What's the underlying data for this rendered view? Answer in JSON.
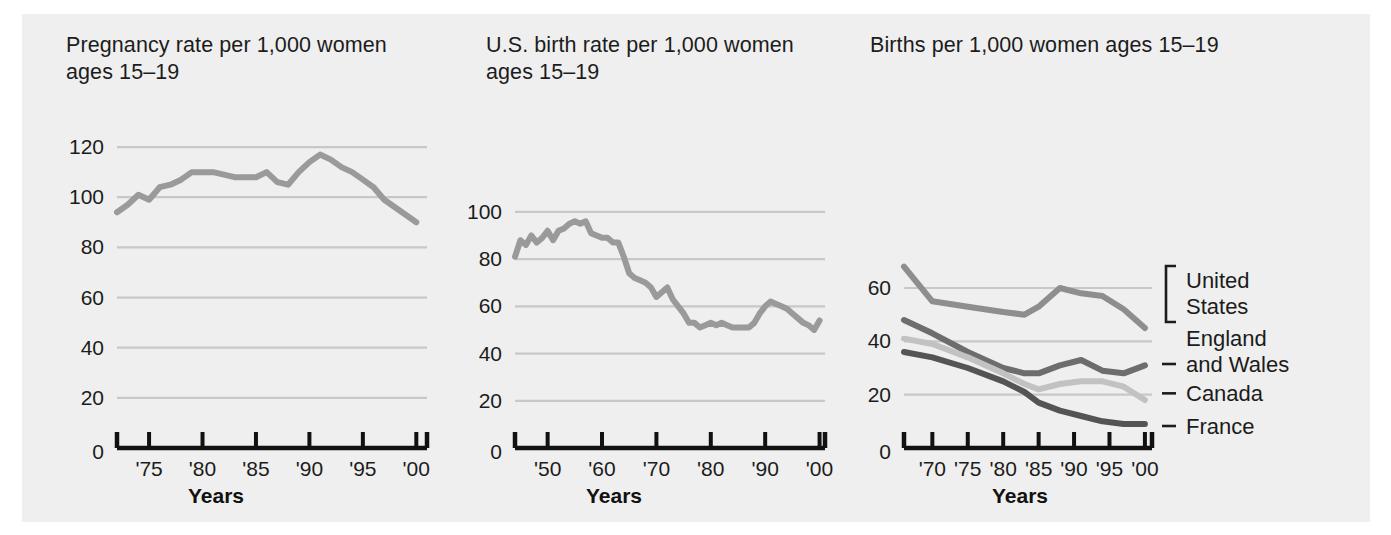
{
  "figure": {
    "background": "#efefef",
    "page_background": "#ffffff"
  },
  "charts": [
    {
      "id": "pregnancy-rate",
      "title": "Pregnancy rate per 1,000 women\nages 15–19",
      "xlabel": "Years",
      "ylabel": "",
      "type": "line",
      "grid": true,
      "legend": "none",
      "ylim": [
        0,
        128
      ],
      "yticks": [
        0,
        20,
        40,
        60,
        80,
        100,
        120
      ],
      "ytick_labels": [
        "0",
        "20",
        "40",
        "60",
        "80",
        "100",
        "120"
      ],
      "xlim": [
        1972,
        2001
      ],
      "xticks": [
        1975,
        1980,
        1985,
        1990,
        1995,
        2000
      ],
      "xtick_labels": [
        "'75",
        "'80",
        "'85",
        "'90",
        "'95",
        "'00"
      ],
      "line_color": "#9a9a9a",
      "series": [
        {
          "name": "Pregnancy rate",
          "x": [
            1972,
            1973,
            1974,
            1975,
            1976,
            1977,
            1978,
            1979,
            1980,
            1981,
            1982,
            1983,
            1984,
            1985,
            1986,
            1987,
            1988,
            1989,
            1990,
            1991,
            1992,
            1993,
            1994,
            1995,
            1996,
            1997,
            1998,
            1999,
            2000
          ],
          "values": [
            94,
            97,
            101,
            99,
            104,
            105,
            107,
            110,
            110,
            110,
            109,
            108,
            108,
            108,
            110,
            106,
            105,
            110,
            114,
            117,
            115,
            112,
            110,
            107,
            104,
            99,
            96,
            93,
            90
          ]
        }
      ]
    },
    {
      "id": "us-birth-rate",
      "title": "U.S. birth rate per 1,000 women\nages 15–19",
      "xlabel": "Years",
      "ylabel": "",
      "type": "line",
      "grid": true,
      "legend": "none",
      "ylim": [
        0,
        108
      ],
      "yticks": [
        0,
        20,
        40,
        60,
        80,
        100
      ],
      "ytick_labels": [
        "0",
        "20",
        "40",
        "60",
        "80",
        "100"
      ],
      "xlim": [
        1944,
        2001
      ],
      "xticks": [
        1950,
        1960,
        1970,
        1980,
        1990,
        2000
      ],
      "xtick_labels": [
        "'50",
        "'60",
        "'70",
        "'80",
        "'90",
        "'00"
      ],
      "line_color": "#9a9a9a",
      "series": [
        {
          "name": "U.S. birth rate",
          "x": [
            1944,
            1945,
            1946,
            1947,
            1948,
            1949,
            1950,
            1951,
            1952,
            1953,
            1954,
            1955,
            1956,
            1957,
            1958,
            1959,
            1960,
            1961,
            1962,
            1963,
            1964,
            1965,
            1966,
            1967,
            1968,
            1969,
            1970,
            1971,
            1972,
            1973,
            1974,
            1975,
            1976,
            1977,
            1978,
            1979,
            1980,
            1981,
            1982,
            1983,
            1984,
            1985,
            1986,
            1987,
            1988,
            1989,
            1990,
            1991,
            1992,
            1993,
            1994,
            1995,
            1996,
            1997,
            1998,
            1999,
            2000
          ],
          "values": [
            81,
            88,
            86,
            90,
            87,
            89,
            92,
            88,
            92,
            93,
            95,
            96,
            95,
            96,
            91,
            90,
            89,
            89,
            87,
            87,
            81,
            74,
            72,
            71,
            70,
            68,
            64,
            66,
            68,
            63,
            60,
            57,
            53,
            53,
            51,
            52,
            53,
            52,
            53,
            52,
            51,
            51,
            51,
            51,
            53,
            57,
            60,
            62,
            61,
            60,
            59,
            57,
            55,
            53,
            52,
            50,
            54
          ]
        }
      ]
    },
    {
      "id": "births-by-country",
      "title": "Births per 1,000 women ages 15–19",
      "xlabel": "Years",
      "ylabel": "",
      "type": "line",
      "grid": true,
      "legend": "right",
      "ylim": [
        0,
        72
      ],
      "yticks": [
        0,
        20,
        40,
        60
      ],
      "ytick_labels": [
        "0",
        "20",
        "40",
        "60"
      ],
      "xlim": [
        1966,
        2001
      ],
      "xticks": [
        1970,
        1975,
        1980,
        1985,
        1990,
        1995,
        2000
      ],
      "xtick_labels": [
        "'70",
        "'75",
        "'80",
        "'85",
        "'90",
        "'95",
        "'00"
      ],
      "legend_items": [
        {
          "label": "United\nStates",
          "color": "#8e8e8e",
          "marker": "bracket"
        },
        {
          "label": "England\nand Wales",
          "color": "#6d6d6d",
          "marker": "dash"
        },
        {
          "label": "Canada",
          "color": "#c2c2c2",
          "marker": "dash"
        },
        {
          "label": "France",
          "color": "#545454",
          "marker": "dash"
        }
      ],
      "series": [
        {
          "name": "United States",
          "color": "#8e8e8e",
          "x": [
            1966,
            1970,
            1975,
            1980,
            1983,
            1985,
            1988,
            1991,
            1994,
            1997,
            2000
          ],
          "values": [
            68,
            55,
            53,
            51,
            50,
            53,
            60,
            58,
            57,
            52,
            45
          ]
        },
        {
          "name": "England and Wales",
          "color": "#6d6d6d",
          "x": [
            1966,
            1970,
            1975,
            1980,
            1983,
            1985,
            1988,
            1991,
            1994,
            1997,
            2000
          ],
          "values": [
            48,
            43,
            36,
            30,
            28,
            28,
            31,
            33,
            29,
            28,
            31
          ]
        },
        {
          "name": "Canada",
          "color": "#c2c2c2",
          "x": [
            1966,
            1970,
            1975,
            1980,
            1983,
            1985,
            1988,
            1991,
            1994,
            1997,
            2000
          ],
          "values": [
            41,
            39,
            34,
            28,
            24,
            22,
            24,
            25,
            25,
            23,
            18
          ]
        },
        {
          "name": "France",
          "color": "#545454",
          "x": [
            1966,
            1970,
            1975,
            1980,
            1983,
            1985,
            1988,
            1991,
            1994,
            1997,
            2000
          ],
          "values": [
            36,
            34,
            30,
            25,
            21,
            17,
            14,
            12,
            10,
            9,
            9
          ]
        }
      ]
    }
  ]
}
